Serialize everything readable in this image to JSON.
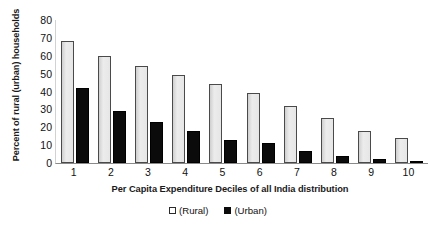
{
  "chart_data": {
    "type": "bar",
    "title": "",
    "xlabel": "Per Capita Expenditure Deciles of all India distribution",
    "ylabel": "Percent of rural (urban) households",
    "categories": [
      "1",
      "2",
      "3",
      "4",
      "5",
      "6",
      "7",
      "8",
      "9",
      "10"
    ],
    "series": [
      {
        "name": "(Rural)",
        "color": "#e3e3e3",
        "values": [
          68,
          60,
          54,
          49,
          44,
          39,
          32,
          25,
          18,
          14
        ]
      },
      {
        "name": "(Urban)",
        "color": "#0b0b0b",
        "values": [
          42,
          29,
          23,
          18,
          13,
          11,
          7,
          4,
          2,
          0.5
        ]
      }
    ],
    "ylim": [
      0,
      80
    ],
    "yticks": [
      80,
      70,
      60,
      50,
      40,
      30,
      20,
      10,
      0
    ],
    "grid": false,
    "legend_position": "bottom-center"
  },
  "legend": {
    "rural_label": "(Rural)",
    "urban_label": "(Urban)"
  }
}
